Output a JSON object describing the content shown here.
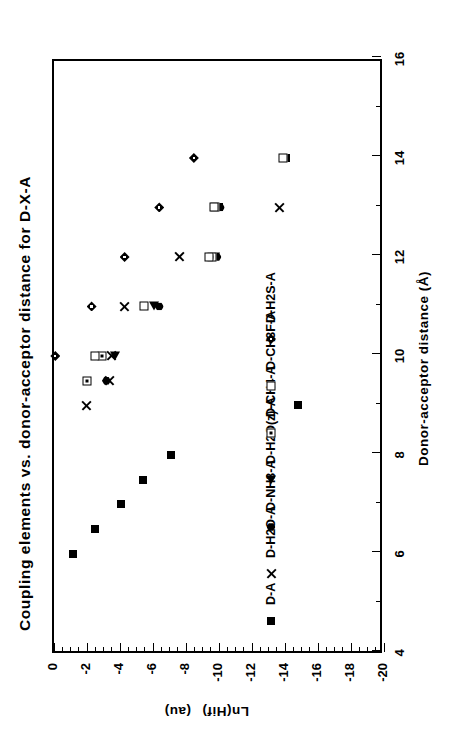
{
  "figure": {
    "title": "Coupling elements  vs.  donor-acceptor  distance  for   D-X-A",
    "title_words": [
      "Coupling",
      "elements",
      "vs.",
      "donor-acceptor",
      "distance",
      "for",
      "D-X-A"
    ]
  },
  "chart_data": {
    "type": "scatter",
    "title": "Coupling elements  vs.  donor-acceptor  distance  for  D-X-A",
    "xlabel": "Donor-acceptor  distance  (Å)",
    "ylabel": "Ln(Hif)",
    "ylabel_units": "(au)",
    "xlim": [
      4,
      16
    ],
    "ylim": [
      -20,
      0
    ],
    "xticks": [
      4,
      6,
      8,
      10,
      12,
      14,
      16
    ],
    "xticklabels": [
      "4",
      "6",
      "8",
      "10",
      "12",
      "14",
      "16"
    ],
    "xminor_step": 1,
    "yticks": [
      0,
      -2,
      -4,
      -6,
      -8,
      -10,
      -12,
      -14,
      -16,
      -18,
      -20
    ],
    "yticklabels": [
      "0",
      "-2",
      "-4",
      "-6",
      "-8",
      "-10",
      "-12",
      "-14",
      "-16",
      "-18",
      "-20"
    ],
    "yminor_step": 0.5,
    "grid": false,
    "legend_position": "inside-lower-left",
    "series": [
      {
        "name": "D-A",
        "marker": "filled-square",
        "points": [
          {
            "x": 6.0,
            "y": -1.3
          },
          {
            "x": 6.5,
            "y": -2.6
          },
          {
            "x": 7.0,
            "y": -4.2
          },
          {
            "x": 7.5,
            "y": -5.5
          },
          {
            "x": 8.0,
            "y": -7.2
          },
          {
            "x": 9.0,
            "y": -14.9
          },
          {
            "x": 13.0,
            "y": -10.1
          },
          {
            "x": 14.0,
            "y": -14.2
          }
        ]
      },
      {
        "name": "D-H2O-A",
        "marker": "cross",
        "points": [
          {
            "x": 9.0,
            "y": -2.1
          },
          {
            "x": 9.5,
            "y": -3.5
          },
          {
            "x": 10.0,
            "y": -3.6
          },
          {
            "x": 11.0,
            "y": -4.4
          },
          {
            "x": 12.0,
            "y": -7.7
          },
          {
            "x": 13.0,
            "y": -13.8
          }
        ]
      },
      {
        "name": "D-NH3-A",
        "marker": "filled-hexagon",
        "points": [
          {
            "x": 9.5,
            "y": -3.3
          },
          {
            "x": 11.0,
            "y": -6.5
          },
          {
            "x": 12.0,
            "y": -10.0
          },
          {
            "x": 13.0,
            "y": -10.2
          }
        ]
      },
      {
        "name": "D-H2O(z)-A",
        "marker": "left-triangle",
        "points": [
          {
            "x": 10.0,
            "y": -3.8
          },
          {
            "x": 11.0,
            "y": -6.2
          },
          {
            "x": 12.0,
            "y": -9.9
          }
        ]
      },
      {
        "name": "D-CH4-A",
        "marker": "dotted-square",
        "points": [
          {
            "x": 9.5,
            "y": -2.1
          },
          {
            "x": 10.0,
            "y": -3.0
          },
          {
            "x": 12.0,
            "y": -9.7
          },
          {
            "x": 13.0,
            "y": -9.9
          }
        ]
      },
      {
        "name": "D-CH3F-A",
        "marker": "open-square",
        "points": [
          {
            "x": 10.0,
            "y": -2.6
          },
          {
            "x": 11.0,
            "y": -5.6
          },
          {
            "x": 12.0,
            "y": -9.5
          },
          {
            "x": 13.0,
            "y": -9.8
          },
          {
            "x": 14.0,
            "y": -14.0
          }
        ]
      },
      {
        "name": "D-H2S-A",
        "marker": "dotted-diamond",
        "points": [
          {
            "x": 10.0,
            "y": -0.2
          },
          {
            "x": 11.0,
            "y": -2.4
          },
          {
            "x": 12.0,
            "y": -4.4
          },
          {
            "x": 13.0,
            "y": -6.5
          },
          {
            "x": 14.0,
            "y": -8.6
          }
        ]
      }
    ]
  },
  "legend": {
    "entries": [
      {
        "label": "D-A",
        "marker": "filled-square"
      },
      {
        "label": "D-H2O-A",
        "marker": "cross"
      },
      {
        "label": "D-NH3-A",
        "marker": "filled-hexagon"
      },
      {
        "label": "D-H2O(z)-A",
        "marker": "left-triangle"
      },
      {
        "label": "D-CH4-A",
        "marker": "dotted-square"
      },
      {
        "label": "D-CH3F-A",
        "marker": "open-square"
      },
      {
        "label": "D-H2S-A",
        "marker": "dotted-diamond"
      }
    ]
  },
  "colors": {
    "ink": "#000000",
    "paper": "#ffffff"
  }
}
